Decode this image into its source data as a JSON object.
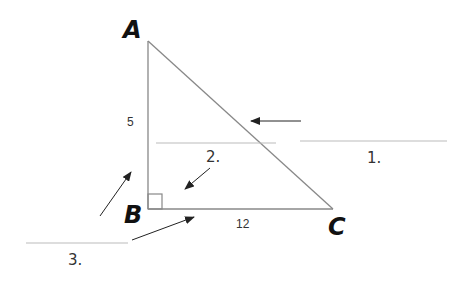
{
  "diagram": {
    "vertices": {
      "A": {
        "label": "A"
      },
      "B": {
        "label": "B"
      },
      "C": {
        "label": "C"
      }
    },
    "sides": {
      "AB": {
        "label": "5"
      },
      "BC": {
        "label": "12"
      }
    },
    "blanks": [
      {
        "label": "1."
      },
      {
        "label": "2."
      },
      {
        "label": "3."
      }
    ],
    "colors": {
      "line": "#888888",
      "arrow": "#222222",
      "blank": "#bbbbbb"
    }
  }
}
